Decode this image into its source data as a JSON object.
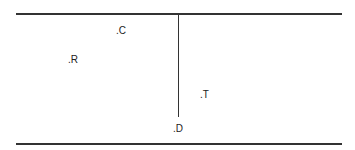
{
  "diagram": {
    "line_color": "#333333",
    "labels": [
      {
        "id": "C",
        "text": ".C"
      },
      {
        "id": "R",
        "text": ".R"
      },
      {
        "id": "T",
        "text": ".T"
      },
      {
        "id": "D",
        "text": ".D"
      }
    ]
  }
}
